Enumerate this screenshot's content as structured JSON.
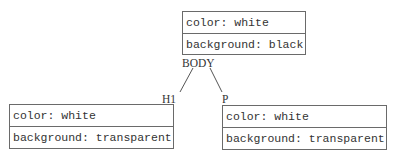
{
  "diagram": {
    "type": "style-inheritance-tree",
    "nodes": [
      {
        "id": "body",
        "label": "BODY",
        "properties": [
          "color: white",
          "background: black"
        ]
      },
      {
        "id": "h1",
        "label": "H1",
        "properties": [
          "color: white",
          "background: transparent"
        ]
      },
      {
        "id": "p",
        "label": "P",
        "properties": [
          "color: white",
          "background: transparent"
        ]
      }
    ],
    "edges": [
      {
        "from": "BODY",
        "to": "H1"
      },
      {
        "from": "BODY",
        "to": "P"
      }
    ],
    "colors": {
      "border": "#6a6a6a",
      "text": "#333333",
      "background": "#ffffff"
    }
  }
}
